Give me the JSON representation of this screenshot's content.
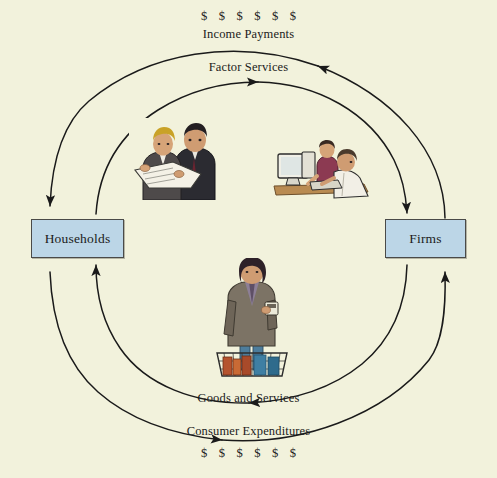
{
  "diagram": {
    "background_color": "#f2f2dc",
    "box_fill_color": "#bcd6e7",
    "box_border_color": "#4a4a48",
    "line_color": "#1a1a1a"
  },
  "sectors": {
    "households": {
      "label": "Households"
    },
    "firms": {
      "label": "Firms"
    }
  },
  "flows": {
    "income_payments": {
      "money_symbols": "$ $ $ $ $ $",
      "label": "Income Payments",
      "direction": "firms-to-households",
      "arc": "top-outer"
    },
    "factor_services": {
      "label": "Factor Services",
      "direction": "households-to-firms",
      "arc": "top-inner"
    },
    "goods_and_services": {
      "label": "Goods and Services",
      "direction": "firms-to-households",
      "arc": "bottom-inner"
    },
    "consumer_expenditures": {
      "label": "Consumer Expenditures",
      "money_symbols": "$ $ $ $ $ $",
      "direction": "households-to-firms",
      "arc": "bottom-outer"
    }
  },
  "illustrations": {
    "households": {
      "name": "two-businessmen-reviewing-documents"
    },
    "firms": {
      "name": "two-office-workers-at-computer"
    },
    "consumer": {
      "name": "woman-shopper-with-basket"
    }
  }
}
